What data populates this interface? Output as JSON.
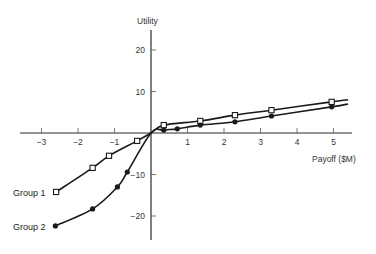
{
  "chart_data": {
    "type": "line",
    "title": "",
    "xlabel": "Payoff ($M)",
    "ylabel": "Utility",
    "xlim": [
      -3.3,
      5.5
    ],
    "ylim": [
      -25,
      25
    ],
    "grid": false,
    "legend_position": "inline-left",
    "x_ticks": [
      -3,
      -2,
      -1,
      1,
      2,
      3,
      4,
      5
    ],
    "x_tick_labels": [
      "−3",
      "−2",
      "−1",
      "1",
      "2",
      "3",
      "4",
      "5"
    ],
    "y_ticks": [
      20,
      10,
      -10,
      -20
    ],
    "y_tick_labels": [
      "20",
      "10",
      "−10",
      "−20"
    ],
    "series": [
      {
        "name": "Group 1",
        "marker": "open-square",
        "x": [
          -2.6,
          -1.6,
          -1.15,
          -0.38,
          0,
          0.35,
          1.35,
          2.3,
          3.3,
          4.95,
          5.4
        ],
        "y": [
          -14.2,
          -8.4,
          -5.5,
          -1.9,
          0,
          1.9,
          2.9,
          4.3,
          5.5,
          7.5,
          8.0
        ],
        "marker_points": [
          [
            -2.6,
            -14.2
          ],
          [
            -1.6,
            -8.4
          ],
          [
            -1.15,
            -5.5
          ],
          [
            -0.38,
            -1.9
          ],
          [
            0.35,
            1.9
          ],
          [
            1.35,
            2.9
          ],
          [
            2.3,
            4.3
          ],
          [
            3.3,
            5.5
          ],
          [
            4.95,
            7.5
          ]
        ]
      },
      {
        "name": "Group 2",
        "marker": "filled-circle",
        "x": [
          -2.62,
          -1.6,
          -0.92,
          -0.65,
          0,
          0.35,
          0.72,
          1.35,
          2.3,
          3.3,
          4.95,
          5.4
        ],
        "y": [
          -22.4,
          -18.3,
          -13.0,
          -9.4,
          0,
          0.7,
          1.0,
          1.9,
          2.7,
          4.1,
          6.3,
          7.0
        ],
        "marker_points": [
          [
            -2.62,
            -22.4
          ],
          [
            -1.6,
            -18.3
          ],
          [
            -0.92,
            -13.0
          ],
          [
            -0.65,
            -9.4
          ],
          [
            0.35,
            0.7
          ],
          [
            0.72,
            1.0
          ],
          [
            1.35,
            1.9
          ],
          [
            2.3,
            2.7
          ],
          [
            3.3,
            4.1
          ],
          [
            4.95,
            6.3
          ]
        ]
      }
    ],
    "annotations": [
      "Group 1",
      "Group 2"
    ]
  },
  "labels": {
    "y_axis_title": "Utility",
    "x_axis_title": "Payoff ($M)",
    "group1": "Group 1",
    "group2": "Group 2"
  },
  "colors": {
    "line": "#1a1a1a",
    "axis": "#2a2a2a",
    "text": "#333333",
    "background": "#ffffff"
  }
}
